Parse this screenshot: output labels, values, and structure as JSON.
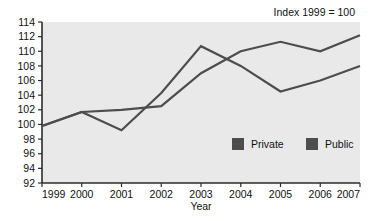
{
  "chart_data": {
    "type": "line",
    "title": "",
    "subtitle": "",
    "annotation": "Index 1999 = 100",
    "xlabel": "Year",
    "ylabel": "",
    "categories": [
      "1999",
      "2000",
      "2001",
      "2002",
      "2003",
      "2004",
      "2005",
      "2006",
      "2007"
    ],
    "x": [
      1999,
      2000,
      2001,
      2002,
      2003,
      2004,
      2005,
      2006,
      2007
    ],
    "xlim": [
      1999,
      2007
    ],
    "ylim": [
      92,
      114
    ],
    "ytick_labels": [
      "92",
      "94",
      "96",
      "98",
      "100",
      "102",
      "104",
      "106",
      "108",
      "110",
      "112",
      "114"
    ],
    "yticks": [
      92,
      94,
      96,
      98,
      100,
      102,
      104,
      106,
      108,
      110,
      112,
      114
    ],
    "grid": false,
    "legend_position": "inside-lower-right",
    "series": [
      {
        "name": "Private",
        "values": [
          99.8,
          101.7,
          99.2,
          104.3,
          110.7,
          108.0,
          104.5,
          106.0,
          108.0
        ],
        "color": "#4d4d4d"
      },
      {
        "name": "Public",
        "values": [
          99.8,
          101.7,
          102.0,
          102.5,
          107.0,
          110.0,
          111.3,
          110.0,
          112.2
        ],
        "color": "#4d4d4d"
      }
    ]
  },
  "legend": {
    "items": [
      {
        "label": "Private",
        "swatch_color": "#4d4d4d"
      },
      {
        "label": "Public",
        "swatch_color": "#4d4d4d"
      }
    ]
  },
  "axes": {
    "x_axis_title": "Year",
    "annotation_text": "Index 1999 = 100"
  }
}
